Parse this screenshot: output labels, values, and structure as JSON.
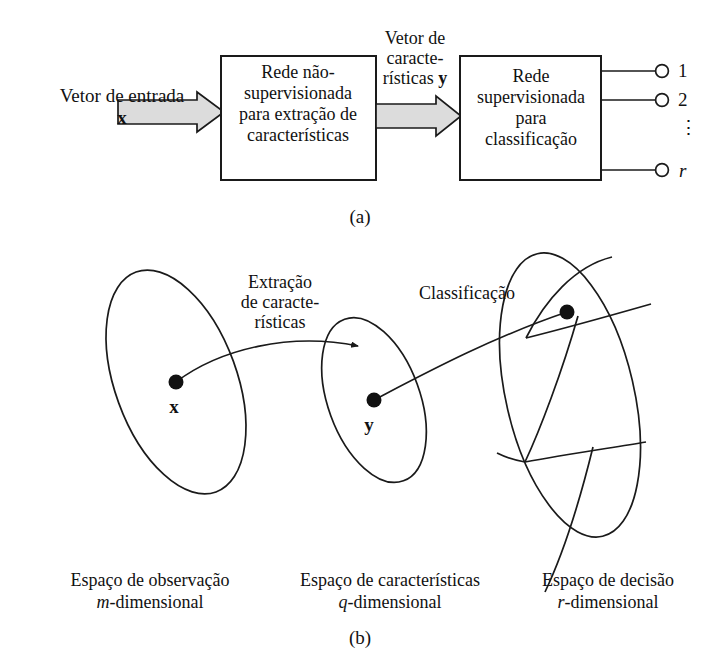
{
  "figure": {
    "panel_a": {
      "input_label": "Vetor de entrada",
      "input_vector_symbol": "x",
      "box1_lines": [
        "Rede não-",
        "supervisionada",
        "para extração de",
        "características"
      ],
      "middle_label_lines": [
        "Vetor de",
        "caracte-",
        "rísticas y"
      ],
      "box2_lines": [
        "Rede",
        "supervisionada",
        "para",
        "classificação"
      ],
      "outputs": [
        "1",
        "2",
        "r"
      ],
      "vertical_dots": "⋮",
      "caption": "(a)"
    },
    "panel_b": {
      "extraction_label_lines": [
        "Extração",
        "de caracte-",
        "rísticas"
      ],
      "classification_label": "Classificação",
      "point_x_symbol": "x",
      "point_y_symbol": "y",
      "space_captions": [
        {
          "line1": "Espaço de observação",
          "var": "m",
          "line2": "-dimensional"
        },
        {
          "line1": "Espaço de características",
          "var": "q",
          "line2": "-dimensional"
        },
        {
          "line1": "Espaço de decisão",
          "var": "r",
          "line2": "-dimensional"
        }
      ],
      "caption": "(b)"
    }
  },
  "colors": {
    "stroke": "#1a1a1a",
    "arrow_fill": "#dcdcdc",
    "background": "#ffffff",
    "text": "#111111"
  }
}
